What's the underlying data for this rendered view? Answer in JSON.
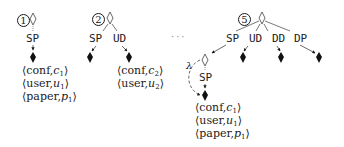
{
  "diagram": {
    "panels": [
      {
        "step": "1",
        "children": [
          "SP"
        ],
        "tuples": [
          {
            "rel": "conf",
            "var": "c",
            "sub": "1"
          },
          {
            "rel": "user",
            "var": "u",
            "sub": "1"
          },
          {
            "rel": "paper",
            "var": "p",
            "sub": "1"
          }
        ]
      },
      {
        "step": "2",
        "children": [
          "SP",
          "UD"
        ],
        "tuples": [
          {
            "rel": "conf",
            "var": "c",
            "sub": "2"
          },
          {
            "rel": "user",
            "var": "u",
            "sub": "2"
          }
        ]
      },
      {
        "step": "5",
        "children": [
          "SP",
          "UD",
          "DD",
          "DP"
        ],
        "sub_node": {
          "children": [
            "SP"
          ],
          "edge_label": "λ"
        },
        "tuples": [
          {
            "rel": "conf",
            "var": "c",
            "sub": "1"
          },
          {
            "rel": "user",
            "var": "u",
            "sub": "1"
          },
          {
            "rel": "paper",
            "var": "p",
            "sub": "1"
          }
        ]
      }
    ],
    "ellipsis": "···",
    "colors": {
      "ink": "#1a1a1a",
      "light": "#888888"
    }
  }
}
